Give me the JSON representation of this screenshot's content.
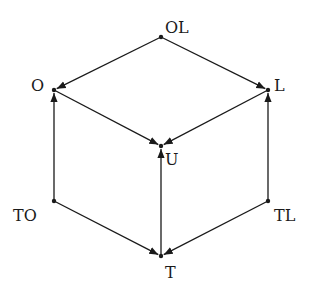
{
  "diagram": {
    "type": "directed-graph",
    "shape": "cube (Hasse-like lattice)",
    "nodes": [
      {
        "id": "OL",
        "label": "OL",
        "x": 161,
        "y": 37,
        "label_x": 165,
        "label_y": 33
      },
      {
        "id": "O",
        "label": "O",
        "x": 54,
        "y": 90,
        "label_x": 31,
        "label_y": 91
      },
      {
        "id": "L",
        "label": "L",
        "x": 268,
        "y": 90,
        "label_x": 274,
        "label_y": 91
      },
      {
        "id": "U",
        "label": "U",
        "x": 161,
        "y": 146,
        "label_x": 165,
        "label_y": 165
      },
      {
        "id": "TO",
        "label": "TO",
        "x": 54,
        "y": 201,
        "label_x": 13,
        "label_y": 221
      },
      {
        "id": "TL",
        "label": "TL",
        "x": 268,
        "y": 201,
        "label_x": 274,
        "label_y": 221
      },
      {
        "id": "T",
        "label": "T",
        "x": 161,
        "y": 256,
        "label_x": 165,
        "label_y": 278
      }
    ],
    "edges": [
      {
        "from": "OL",
        "to": "O"
      },
      {
        "from": "OL",
        "to": "L"
      },
      {
        "from": "O",
        "to": "U"
      },
      {
        "from": "L",
        "to": "U"
      },
      {
        "from": "TO",
        "to": "O"
      },
      {
        "from": "TL",
        "to": "L"
      },
      {
        "from": "T",
        "to": "U"
      },
      {
        "from": "TO",
        "to": "T"
      },
      {
        "from": "TL",
        "to": "T"
      }
    ],
    "colors": {
      "stroke": "#1a1a1a",
      "background": "#ffffff"
    }
  }
}
